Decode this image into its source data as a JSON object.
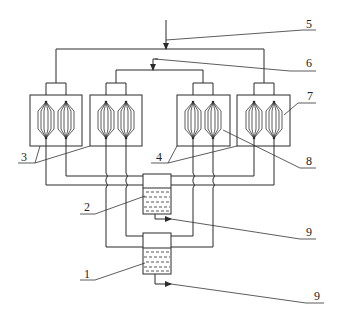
{
  "diagram": {
    "type": "process-flow-schematic",
    "line_color": "#2b2b2b",
    "background": "#ffffff",
    "labels": [
      {
        "id": "1",
        "text": "1",
        "describes": "lower collection tank"
      },
      {
        "id": "2",
        "text": "2",
        "describes": "upper collection tank"
      },
      {
        "id": "3",
        "text": "3",
        "describes": "outer heat-exchanger units (left pair)"
      },
      {
        "id": "4",
        "text": "4",
        "describes": "inner heat-exchanger units (right pair)"
      },
      {
        "id": "5",
        "text": "5",
        "describes": "main feed inlet"
      },
      {
        "id": "6",
        "text": "6",
        "describes": "secondary feed inlet"
      },
      {
        "id": "7",
        "text": "7",
        "describes": "housing"
      },
      {
        "id": "8",
        "text": "8",
        "describes": "tube bundle element"
      },
      {
        "id": "9a",
        "text": "9",
        "describes": "outlet from tank 2"
      },
      {
        "id": "9b",
        "text": "9",
        "describes": "outlet from tank 1"
      }
    ],
    "units": [
      {
        "name": "unit-1",
        "x": 30,
        "y": 95,
        "w": 52,
        "h": 51,
        "elements": 2
      },
      {
        "name": "unit-2",
        "x": 90,
        "y": 95,
        "w": 52,
        "h": 51,
        "elements": 2
      },
      {
        "name": "unit-3",
        "x": 177,
        "y": 95,
        "w": 53,
        "h": 51,
        "elements": 2
      },
      {
        "name": "unit-4",
        "x": 237,
        "y": 95,
        "w": 53,
        "h": 51,
        "elements": 2
      }
    ],
    "tanks": [
      {
        "name": "tank-2",
        "x": 143,
        "y": 174,
        "w": 28,
        "h": 40,
        "liquid_top": 188
      },
      {
        "name": "tank-1",
        "x": 143,
        "y": 233,
        "w": 28,
        "h": 41,
        "liquid_top": 248
      }
    ]
  }
}
